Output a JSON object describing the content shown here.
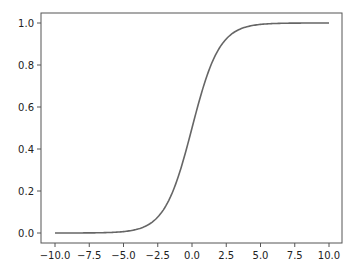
{
  "chart_data": {
    "type": "line",
    "title": "",
    "xlabel": "",
    "ylabel": "",
    "xlim": [
      -11.0,
      11.0
    ],
    "ylim": [
      -0.05,
      1.05
    ],
    "grid": false,
    "legend": null,
    "x_ticks": [
      "-10.0",
      "-7.5",
      "-5.0",
      "-2.5",
      "0.0",
      "2.5",
      "5.0",
      "7.5",
      "10.0"
    ],
    "y_ticks": [
      "0.0",
      "0.2",
      "0.4",
      "0.6",
      "0.8",
      "1.0"
    ],
    "series": [
      {
        "name": "sigmoid",
        "color": "#666666",
        "function": "1/(1+exp(-x))",
        "x": [
          -10,
          -7.5,
          -5,
          -2.5,
          -1,
          0,
          1,
          2.5,
          5,
          7.5,
          10
        ],
        "y": [
          0.0,
          0.0006,
          0.0067,
          0.0759,
          0.2689,
          0.5,
          0.7311,
          0.9241,
          0.9933,
          0.9994,
          1.0
        ]
      }
    ]
  }
}
